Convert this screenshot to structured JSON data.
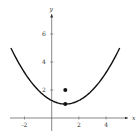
{
  "chart_data": {
    "type": "line",
    "title": "",
    "xlabel": "x",
    "ylabel": "y",
    "xlim": [
      -3.2,
      5.8
    ],
    "ylim": [
      -1.2,
      7.5
    ],
    "grid": false,
    "x_ticks": [
      -2,
      2,
      4
    ],
    "x_tick_labels": [
      "-2",
      "2",
      "4"
    ],
    "y_ticks": [
      2,
      4,
      6
    ],
    "y_tick_labels": [
      "2",
      "4",
      "6"
    ],
    "series": [
      {
        "name": "parabola",
        "equation": "y = (x-1)^2/4 + 1",
        "x": [
          -3,
          -2,
          -1,
          0,
          1,
          2,
          3,
          4,
          5
        ],
        "y": [
          5,
          3.25,
          2,
          1.25,
          1,
          1.25,
          2,
          3.25,
          5
        ]
      }
    ],
    "points": [
      {
        "name": "vertex",
        "x": 1,
        "y": 1
      },
      {
        "name": "focus",
        "x": 1,
        "y": 2
      }
    ]
  },
  "labels": {
    "x_axis": "x",
    "y_axis": "y",
    "xt_neg2": "-2",
    "xt_2": "2",
    "xt_4": "4",
    "yt_2": "2",
    "yt_4": "4",
    "yt_6": "6"
  }
}
